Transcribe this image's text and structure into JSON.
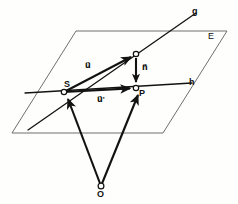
{
  "figure": {
    "background_color": "#fefefd",
    "stroke_color": "#1a1a1a",
    "plane_stroke_color": "#6b6b6b",
    "labels": {
      "plane": "E",
      "line_g": "g",
      "line_h": "h",
      "point_s": "S",
      "point_p": "P",
      "point_o": "O",
      "vector_u": "u⃗",
      "vector_u_prime": "u⃗'",
      "vector_n": "n⃗"
    },
    "geometry": {
      "plane_polygon": "76,31 227,31 163,133 12,133",
      "line_g": {
        "x1": 28,
        "y1": 130,
        "x2": 196,
        "y2": 13
      },
      "line_h": {
        "x1": 25,
        "y1": 93,
        "x2": 192,
        "y2": 83
      },
      "point_s": {
        "x": 64,
        "y": 92
      },
      "point_p": {
        "x": 136,
        "y": 88
      },
      "point_q": {
        "x": 136,
        "y": 54
      },
      "point_o": {
        "x": 101,
        "y": 186
      },
      "vector_u": {
        "x1": 64,
        "y1": 92,
        "x2": 133,
        "y2": 56
      },
      "vector_u_prime": {
        "x1": 64,
        "y1": 92,
        "x2": 132,
        "y2": 88
      },
      "vector_n": {
        "x1": 136,
        "y1": 58,
        "x2": 136,
        "y2": 84
      },
      "vector_o_to_s": {
        "x1": 101,
        "y1": 186,
        "x2": 67,
        "y2": 97
      },
      "vector_o_to_p": {
        "x1": 101,
        "y1": 186,
        "x2": 139,
        "y2": 93
      }
    },
    "label_positions": {
      "plane": {
        "left": 208,
        "top": 32
      },
      "line_g": {
        "left": 192,
        "top": 7
      },
      "line_h": {
        "left": 189,
        "top": 78
      },
      "point_s": {
        "left": 64,
        "top": 80
      },
      "point_p": {
        "left": 139,
        "top": 89
      },
      "point_o": {
        "left": 97,
        "top": 190
      },
      "vector_u": {
        "left": 85,
        "top": 62
      },
      "vector_u_prime": {
        "left": 97,
        "top": 96
      },
      "vector_n": {
        "left": 142,
        "top": 64
      }
    }
  }
}
